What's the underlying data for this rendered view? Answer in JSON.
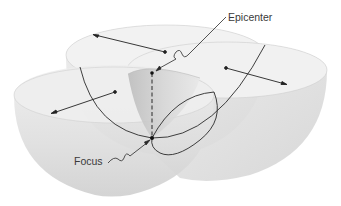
{
  "diagram": {
    "labels": {
      "epicenter": "Epicenter",
      "focus": "Focus"
    },
    "elements": [
      {
        "name": "left-hemisphere-wavefront",
        "shape": "half-sphere bowl"
      },
      {
        "name": "back-hemisphere-wavefront",
        "shape": "half-sphere bowl"
      },
      {
        "name": "right-hemisphere-wavefront",
        "shape": "half-sphere bowl"
      },
      {
        "name": "cutaway-wedge",
        "shape": "shaded quarter section"
      },
      {
        "name": "vertical-dashed-line",
        "from": "epicenter",
        "to": "focus"
      },
      {
        "name": "radius-arrows",
        "count": 3
      }
    ],
    "colors": {
      "bowl_fill": "#e6e6e6",
      "bowl_shade": "#cfcfcf",
      "rim": "#f3f3f3",
      "line": "#2a2a2a",
      "label_text": "#3a3a3a",
      "background": "#ffffff"
    }
  }
}
